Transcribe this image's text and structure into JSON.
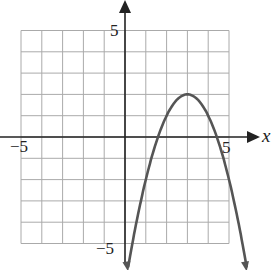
{
  "chart_data": {
    "type": "line",
    "title": "",
    "xlabel": "x",
    "ylabel": "",
    "xlim": [
      -5,
      5
    ],
    "ylim": [
      -5,
      5
    ],
    "grid": true,
    "tick_labels": {
      "x": [
        "-5",
        "5"
      ],
      "y": [
        "5",
        "-5"
      ]
    },
    "series": [
      {
        "name": "parabola",
        "equation": "y = -(x - 3)^2 + 2",
        "vertex": [
          3,
          2
        ],
        "x_intercepts": [
          1.59,
          4.41
        ],
        "x": [
          0.15,
          1,
          2,
          3,
          4,
          5,
          5.85
        ],
        "y": [
          -6.12,
          -2,
          1,
          2,
          1,
          -2,
          -6.12
        ],
        "arrows_at_ends": true,
        "color": "#555555"
      }
    ]
  },
  "labels": {
    "y_top": "5",
    "y_bottom": "−5",
    "x_left": "−5",
    "x_right": "5",
    "x_axis": "x"
  }
}
